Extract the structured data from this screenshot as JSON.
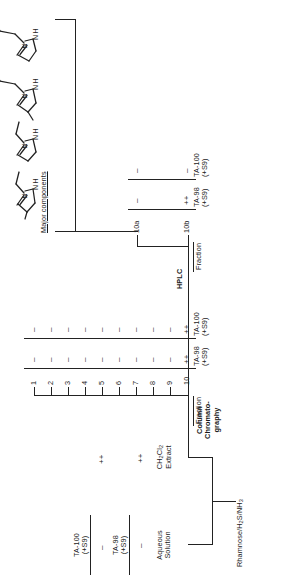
{
  "figure": {
    "orientation": "rotated-90"
  },
  "source": {
    "label_line1": "Rhamnose/H",
    "label_sub1": "2",
    "label_line2": "S/NH",
    "label_sub2": "3"
  },
  "stage1": {
    "headers": [
      "TA-98",
      "(+S9)",
      "TA-100",
      "(+S9)"
    ],
    "header_ta98_line1": "TA-98",
    "header_ta98_line2": "(+S9)",
    "header_ta100_line1": "TA-100",
    "header_ta100_line2": "(+S9)",
    "rows": [
      {
        "name_line1": "Aqueous",
        "name_line2": "Solution",
        "ta98": "–",
        "ta100": "–"
      },
      {
        "name_line1": "CH",
        "name_sub1": "2",
        "name_mid": "Cl",
        "name_sub2": "2",
        "name_line2": "Extract",
        "ta98": "++",
        "ta100": "++"
      }
    ]
  },
  "step1": {
    "label_line1": "Column",
    "label_line2": "Chromato-",
    "label_line3": "graphy"
  },
  "stage2": {
    "col_header_fraction": "Fraction",
    "header_ta98_line1": "TA-98",
    "header_ta98_line2": "(+S9)",
    "header_ta100_line1": "TA-100",
    "header_ta100_line2": "(+S9)",
    "fractions": [
      {
        "name": "1",
        "ta98": "–",
        "ta100": "–"
      },
      {
        "name": "2",
        "ta98": "–",
        "ta100": "–"
      },
      {
        "name": "3",
        "ta98": "–",
        "ta100": "–"
      },
      {
        "name": "4",
        "ta98": "–",
        "ta100": "–"
      },
      {
        "name": "5",
        "ta98": "–",
        "ta100": "–"
      },
      {
        "name": "6",
        "ta98": "–",
        "ta100": "–"
      },
      {
        "name": "7",
        "ta98": "–",
        "ta100": "–"
      },
      {
        "name": "8",
        "ta98": "–",
        "ta100": "–"
      },
      {
        "name": "9",
        "ta98": "–",
        "ta100": "–"
      },
      {
        "name": "10",
        "ta98": "++",
        "ta100": "++"
      }
    ]
  },
  "step2": {
    "label": "HPLC"
  },
  "stage3": {
    "col_header_fraction": "Fraction",
    "header_ta98_line1": "TA-98",
    "header_ta98_line2": "(+S9)",
    "header_ta100_line1": "TA-100",
    "header_ta100_line2": "(+S9)",
    "fractions": [
      {
        "name": "10a",
        "ta98": "–",
        "ta100": "–"
      },
      {
        "name": "10b",
        "ta98": "++",
        "ta100": "–"
      }
    ]
  },
  "products": {
    "caption": "Major components",
    "structures": [
      {
        "id": "structure-1",
        "atom_n": "N",
        "atom_nh": "NH"
      },
      {
        "id": "structure-2",
        "atom_n": "N",
        "atom_nh": "NH"
      },
      {
        "id": "structure-3",
        "atom_n": "N",
        "atom_nh": "NH"
      },
      {
        "id": "structure-4",
        "atom_n": "N",
        "atom_nh": "NH"
      }
    ]
  },
  "colors": {
    "ink": "#222222",
    "background": "#ffffff"
  }
}
